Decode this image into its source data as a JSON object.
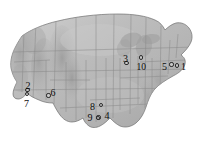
{
  "figure": {
    "name": "united-states-site-map",
    "background_color": "#ffffff",
    "map_fill_color": "#b9b9b9",
    "map_outline_color": "#6e6e6e",
    "state_border_color": "#8c8c8c",
    "marker_outline_color": "#2a2a2a",
    "label_color": "#0d0d0d",
    "width": 207,
    "height": 157
  },
  "sites": [
    {
      "id": 1,
      "label": "1",
      "dot_x": 177.0,
      "dot_y": 65.5,
      "label_x": 181.0,
      "label_y": 62.0
    },
    {
      "id": 2,
      "label": "2",
      "dot_x": 27.5,
      "dot_y": 90.0,
      "label_x": 25.5,
      "label_y": 81.0
    },
    {
      "id": 3,
      "label": "3",
      "dot_x": 126.5,
      "dot_y": 63.0,
      "label_x": 123.0,
      "label_y": 54.0
    },
    {
      "id": 4,
      "label": "4",
      "dot_x": 98.5,
      "dot_y": 117.5,
      "label_x": 104.5,
      "label_y": 110.5
    },
    {
      "id": 5,
      "label": "5",
      "dot_x": 171.5,
      "dot_y": 64.5,
      "label_x": 162.0,
      "label_y": 61.5
    },
    {
      "id": 6,
      "label": "6",
      "dot_x": 48.5,
      "dot_y": 95.5,
      "label_x": 50.5,
      "label_y": 88.0
    },
    {
      "id": 7,
      "label": "7",
      "dot_x": 27.0,
      "dot_y": 94.0,
      "label_x": 24.0,
      "label_y": 99.0
    },
    {
      "id": 8,
      "label": "8",
      "dot_x": 101.0,
      "dot_y": 105.0,
      "label_x": 90.0,
      "label_y": 101.5
    },
    {
      "id": 9,
      "label": "9",
      "dot_x": 98.0,
      "dot_y": 118.0,
      "label_x": 87.5,
      "label_y": 112.5
    },
    {
      "id": 10,
      "label": "10",
      "dot_x": 141.0,
      "dot_y": 57.5,
      "label_x": 136.5,
      "label_y": 62.0
    }
  ]
}
